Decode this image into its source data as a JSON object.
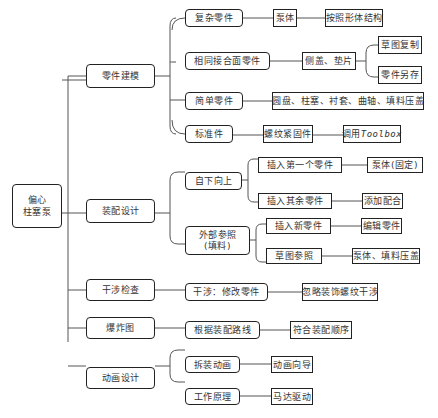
{
  "root": {
    "label_line1": "偏心",
    "label_line2": "柱塞泵"
  },
  "branches": [
    {
      "label": "零件建模",
      "children": [
        {
          "label": "复杂零件",
          "next": "泵体",
          "next2": "按照形体结构"
        },
        {
          "label": "相同接合面零件",
          "next": "侧盖、垫片",
          "leaves": [
            "草图复制",
            "零件另存"
          ]
        },
        {
          "label": "简单零件",
          "next": "圆盘、柱塞、衬套、曲轴、填料压盖"
        },
        {
          "label": "标准件",
          "next": "螺纹紧固件",
          "next2_prefix": "调用",
          "next2_mono": "Toolbox"
        }
      ]
    },
    {
      "label": "装配设计",
      "children": [
        {
          "label": "自下向上",
          "subs": [
            {
              "label": "插入第一个零件",
              "next": "泵体(固定)"
            },
            {
              "label": "插入其余零件",
              "next": "添加配合"
            }
          ]
        },
        {
          "label_line1": "外部参照",
          "label_line2": "(填料)",
          "subs": [
            {
              "label": "插入新零件",
              "next": "编辑零件"
            },
            {
              "label": "草图参照",
              "next": "泵体、填料压盖"
            }
          ]
        }
      ]
    },
    {
      "label": "干涉检查",
      "children": [
        {
          "label": "干涉：修改零件",
          "next": "忽略装饰螺纹干涉"
        }
      ]
    },
    {
      "label": "爆炸图",
      "children": [
        {
          "label": "根据装配路线",
          "next": "符合装配顺序"
        }
      ]
    },
    {
      "label": "动画设计",
      "children": [
        {
          "label": "拆装动画",
          "next": "动画向导"
        },
        {
          "label": "工作原理",
          "next": "马达驱动"
        }
      ]
    }
  ],
  "colors": {
    "line": "#555555",
    "border": "#222222",
    "text": "#333333"
  }
}
